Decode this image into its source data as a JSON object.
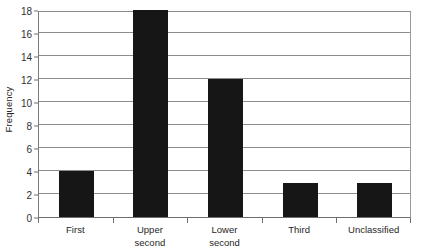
{
  "chart_data": {
    "type": "bar",
    "title": "",
    "xlabel": "",
    "ylabel": "Frequency",
    "categories": [
      "First",
      "Upper second",
      "Lower second",
      "Third",
      "Unclassified"
    ],
    "category_lines": [
      [
        "First"
      ],
      [
        "Upper",
        "second"
      ],
      [
        "Lower",
        "second"
      ],
      [
        "Third"
      ],
      [
        "Unclassified"
      ]
    ],
    "values": [
      4,
      18,
      12,
      3,
      3
    ],
    "ylim": [
      0,
      18
    ],
    "ytick_step": 2,
    "yticks": [
      0,
      2,
      4,
      6,
      8,
      10,
      12,
      14,
      16,
      18
    ],
    "grid": true,
    "legend": false,
    "legend_position": "none",
    "bar_color": "#161616",
    "gridline_color": "#8c8c8c",
    "axis_color": "#6e6e6e",
    "text_color": "#262626",
    "background_color": "#ffffff"
  }
}
